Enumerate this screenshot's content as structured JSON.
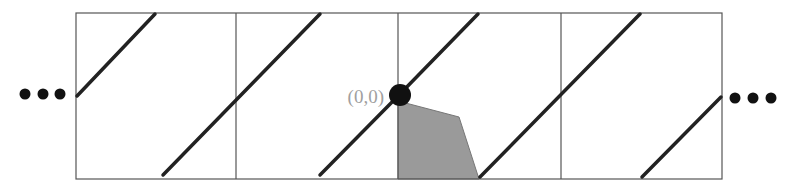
{
  "diagram": {
    "origin_label": "(0,0)",
    "colors": {
      "frame": "#555555",
      "line": "#222222",
      "dot": "#111111",
      "label": "#a0a0a0",
      "shade": "#9a9a9a"
    },
    "frame": {
      "x": 76,
      "y": 13,
      "width": 646,
      "height": 166
    },
    "dividers_x": [
      236,
      398,
      561
    ],
    "diagonals": [
      {
        "x1": 77,
        "y1": 96,
        "x2": 155,
        "y2": 14
      },
      {
        "x1": 163,
        "y1": 175,
        "x2": 320,
        "y2": 14
      },
      {
        "x1": 320,
        "y1": 175,
        "x2": 398,
        "y2": 96
      },
      {
        "x1": 398,
        "y1": 96,
        "x2": 478,
        "y2": 14
      },
      {
        "x1": 480,
        "y1": 177,
        "x2": 640,
        "y2": 14
      },
      {
        "x1": 642,
        "y1": 177,
        "x2": 721,
        "y2": 97
      }
    ],
    "origin_point": {
      "x": 400,
      "y": 95,
      "r": 11
    },
    "shaded_region": "398,101 459,117 479,179 398,179",
    "ellipsis_left": [
      {
        "x": 25,
        "y": 94
      },
      {
        "x": 43,
        "y": 94
      },
      {
        "x": 60,
        "y": 94
      }
    ],
    "ellipsis_right": [
      {
        "x": 735,
        "y": 98
      },
      {
        "x": 753,
        "y": 98
      },
      {
        "x": 771,
        "y": 98
      }
    ]
  }
}
